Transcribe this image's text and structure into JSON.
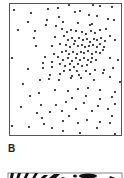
{
  "figure": {
    "panel_b_label": "B",
    "colors": {
      "dot": "#1a1a1a",
      "frame": "#555555",
      "background": "#ffffff"
    }
  },
  "chart_data": {
    "type": "scatter",
    "title": "",
    "xlabel": "",
    "ylabel": "",
    "grid": false,
    "note": "Random point field with a dense cluster in the upper-right; coordinates in panel pixel space (x 10-121, y 4-135).",
    "points": [
      [
        14,
        10
      ],
      [
        31,
        13
      ],
      [
        48,
        9
      ],
      [
        58,
        8
      ],
      [
        69,
        5
      ],
      [
        93,
        5
      ],
      [
        100,
        6
      ],
      [
        112,
        7
      ],
      [
        28,
        22
      ],
      [
        47,
        20
      ],
      [
        59,
        17
      ],
      [
        75,
        12
      ],
      [
        80,
        11
      ],
      [
        89,
        15
      ],
      [
        97,
        16
      ],
      [
        108,
        19
      ],
      [
        18,
        30
      ],
      [
        35,
        31
      ],
      [
        46,
        25
      ],
      [
        56,
        26
      ],
      [
        63,
        22
      ],
      [
        78,
        23
      ],
      [
        90,
        25
      ],
      [
        92,
        24
      ],
      [
        114,
        20
      ],
      [
        62,
        29
      ],
      [
        67,
        32
      ],
      [
        71,
        30
      ],
      [
        76,
        31
      ],
      [
        82,
        32
      ],
      [
        86,
        34
      ],
      [
        91,
        31
      ],
      [
        95,
        33
      ],
      [
        100,
        30
      ],
      [
        106,
        29
      ],
      [
        110,
        36
      ],
      [
        34,
        38
      ],
      [
        55,
        37
      ],
      [
        64,
        36
      ],
      [
        68,
        40
      ],
      [
        72,
        38
      ],
      [
        75,
        41
      ],
      [
        79,
        38
      ],
      [
        83,
        40
      ],
      [
        87,
        39
      ],
      [
        90,
        42
      ],
      [
        94,
        39
      ],
      [
        97,
        40
      ],
      [
        101,
        38
      ],
      [
        105,
        41
      ],
      [
        36,
        46
      ],
      [
        52,
        46
      ],
      [
        60,
        44
      ],
      [
        66,
        45
      ],
      [
        70,
        47
      ],
      [
        74,
        44
      ],
      [
        78,
        46
      ],
      [
        82,
        45
      ],
      [
        85,
        47
      ],
      [
        89,
        46
      ],
      [
        93,
        45
      ],
      [
        97,
        47
      ],
      [
        100,
        44
      ],
      [
        104,
        47
      ],
      [
        115,
        40
      ],
      [
        54,
        54
      ],
      [
        62,
        52
      ],
      [
        66,
        51
      ],
      [
        69,
        54
      ],
      [
        73,
        52
      ],
      [
        77,
        54
      ],
      [
        81,
        52
      ],
      [
        84,
        53
      ],
      [
        88,
        51
      ],
      [
        92,
        54
      ],
      [
        96,
        52
      ],
      [
        100,
        53
      ],
      [
        103,
        50
      ],
      [
        12,
        58
      ],
      [
        45,
        57
      ],
      [
        58,
        57
      ],
      [
        63,
        60
      ],
      [
        68,
        58
      ],
      [
        72,
        61
      ],
      [
        76,
        58
      ],
      [
        80,
        60
      ],
      [
        84,
        58
      ],
      [
        88,
        60
      ],
      [
        92,
        58
      ],
      [
        96,
        60
      ],
      [
        110,
        58
      ],
      [
        118,
        60
      ],
      [
        43,
        63
      ],
      [
        52,
        62
      ],
      [
        60,
        64
      ],
      [
        65,
        66
      ],
      [
        70,
        64
      ],
      [
        74,
        67
      ],
      [
        78,
        64
      ],
      [
        82,
        66
      ],
      [
        87,
        65
      ],
      [
        91,
        62
      ],
      [
        28,
        69
      ],
      [
        43,
        68
      ],
      [
        52,
        67
      ],
      [
        64,
        71
      ],
      [
        70,
        70
      ],
      [
        77,
        71
      ],
      [
        86,
        71
      ],
      [
        95,
        70
      ],
      [
        104,
        70
      ],
      [
        113,
        68
      ],
      [
        50,
        75
      ],
      [
        60,
        74
      ],
      [
        72,
        76
      ],
      [
        79,
        75
      ],
      [
        90,
        74
      ],
      [
        103,
        73
      ],
      [
        23,
        84
      ],
      [
        40,
        80
      ],
      [
        49,
        79
      ],
      [
        59,
        80
      ],
      [
        71,
        78
      ],
      [
        81,
        78
      ],
      [
        94,
        80
      ],
      [
        110,
        77
      ],
      [
        120,
        82
      ],
      [
        39,
        93
      ],
      [
        55,
        90
      ],
      [
        68,
        91
      ],
      [
        78,
        89
      ],
      [
        88,
        88
      ],
      [
        100,
        90
      ],
      [
        115,
        92
      ],
      [
        30,
        96
      ],
      [
        72,
        98
      ],
      [
        86,
        96
      ],
      [
        100,
        99
      ],
      [
        112,
        97
      ],
      [
        21,
        107
      ],
      [
        41,
        105
      ],
      [
        56,
        105
      ],
      [
        66,
        102
      ],
      [
        84,
        103
      ],
      [
        98,
        106
      ],
      [
        115,
        104
      ],
      [
        37,
        113
      ],
      [
        50,
        112
      ],
      [
        62,
        111
      ],
      [
        76,
        109
      ],
      [
        92,
        111
      ],
      [
        108,
        109
      ],
      [
        42,
        118
      ],
      [
        69,
        116
      ],
      [
        87,
        120
      ],
      [
        100,
        122
      ],
      [
        112,
        116
      ],
      [
        12,
        126
      ],
      [
        29,
        127
      ],
      [
        44,
        124
      ],
      [
        52,
        128
      ],
      [
        63,
        121
      ],
      [
        78,
        123
      ],
      [
        97,
        128
      ],
      [
        110,
        123
      ],
      [
        63,
        131
      ],
      [
        80,
        133
      ],
      [
        115,
        134
      ]
    ]
  }
}
